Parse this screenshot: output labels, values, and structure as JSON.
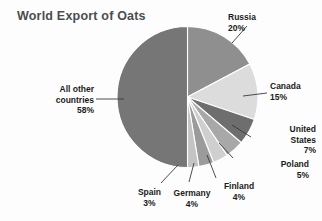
{
  "chart_title": "World Export of Oats",
  "chart_data": {
    "type": "pie",
    "title": "World Export of Oats",
    "xlabel": "",
    "ylabel": "",
    "legend_position": "none",
    "grid": false,
    "unit": "%",
    "categories": [
      "Russia",
      "Canada",
      "United States",
      "Poland",
      "Finland",
      "Germany",
      "Spain",
      "All other countries"
    ],
    "values": [
      20,
      15,
      7,
      5,
      4,
      4,
      3,
      58
    ],
    "slice_colors": [
      "#8f8f8f",
      "#dcdcdc",
      "#6e6e6e",
      "#a8a8a8",
      "#cfcfcf",
      "#9b9b9b",
      "#c4c4c4",
      "#767676"
    ],
    "start_angle_deg": 0,
    "direction": "clockwise",
    "slices": [
      {
        "label": "Russia",
        "value": 20,
        "value_text": "20%",
        "color": "#8f8f8f"
      },
      {
        "label": "Canada",
        "value": 15,
        "value_text": "15%",
        "color": "#dcdcdc"
      },
      {
        "label": "United States",
        "value": 7,
        "value_text": "7%",
        "color": "#6e6e6e"
      },
      {
        "label": "Poland",
        "value": 5,
        "value_text": "5%",
        "color": "#a8a8a8"
      },
      {
        "label": "Finland",
        "value": 4,
        "value_text": "4%",
        "color": "#cfcfcf"
      },
      {
        "label": "Germany",
        "value": 4,
        "value_text": "4%",
        "color": "#9b9b9b"
      },
      {
        "label": "Spain",
        "value": 3,
        "value_text": "3%",
        "color": "#c4c4c4"
      },
      {
        "label": "All other countries",
        "value": 58,
        "value_text": "58%",
        "color": "#767676"
      }
    ]
  },
  "labels": {
    "russia": {
      "name": "Russia",
      "pct": "20%"
    },
    "canada": {
      "name": "Canada",
      "pct": "15%"
    },
    "united_states": {
      "line1": "United",
      "line2": "States",
      "pct": "7%"
    },
    "poland": {
      "name": "Poland",
      "pct": "5%"
    },
    "finland": {
      "name": "Finland",
      "pct": "4%"
    },
    "germany": {
      "name": "Germany",
      "pct": "4%"
    },
    "spain": {
      "name": "Spain",
      "pct": "3%"
    },
    "all_other": {
      "line1": "All other",
      "line2": "countries",
      "pct": "58%"
    }
  },
  "colors": {
    "title": "#4a4d52",
    "label_text": "#1b1b1b",
    "background": "#fdfdfd",
    "leader_line": "#3a3a3a",
    "slice_divider": "#ffffff"
  }
}
